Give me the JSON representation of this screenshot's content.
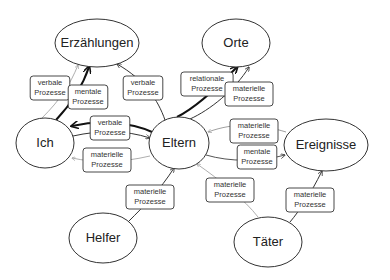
{
  "nodes": [
    {
      "id": "erzaehlungen",
      "label": "Erzählungen",
      "cx": 97,
      "cy": 43,
      "rx": 42,
      "ry": 24
    },
    {
      "id": "orte",
      "label": "Orte",
      "cx": 236,
      "cy": 43,
      "rx": 34,
      "ry": 24
    },
    {
      "id": "ich",
      "label": "Ich",
      "cx": 45,
      "cy": 143,
      "rx": 29,
      "ry": 25
    },
    {
      "id": "eltern",
      "label": "Eltern",
      "cx": 179,
      "cy": 143,
      "rx": 30,
      "ry": 26
    },
    {
      "id": "ereignisse",
      "label": "Ereignisse",
      "cx": 326,
      "cy": 145,
      "rx": 42,
      "ry": 26
    },
    {
      "id": "helfer",
      "label": "Helfer",
      "cx": 103,
      "cy": 238,
      "rx": 34,
      "ry": 25
    },
    {
      "id": "taeter",
      "label": "Täter",
      "cx": 268,
      "cy": 242,
      "rx": 34,
      "ry": 25
    }
  ],
  "edges": [
    {
      "from": "ich",
      "to": "erzaehlungen",
      "label_line1": "verbale",
      "label_line2": "Prozesse",
      "lx": 50,
      "ly": 88,
      "weight": "thin",
      "color": "#999999",
      "path": "M42 118 C 60 100, 70 85, 78 65"
    },
    {
      "from": "ich",
      "to": "erzaehlungen",
      "label_line1": "mentale",
      "label_line2": "Prozesse",
      "lx": 88,
      "ly": 97,
      "weight": "bold",
      "color": "#111111",
      "path": "M56 120 C 70 105, 82 88, 89 67"
    },
    {
      "from": "eltern",
      "to": "erzaehlungen",
      "label_line1": "verbale",
      "label_line2": "Prozesse",
      "lx": 143,
      "ly": 88,
      "weight": "normal",
      "color": "#333333",
      "path": "M165 120 C 158 100, 145 80, 117 64"
    },
    {
      "from": "eltern",
      "to": "orte",
      "label_line1": "relationale",
      "label_line2": "Prozesse",
      "lx": 207,
      "ly": 84,
      "weight": "bold",
      "color": "#111111",
      "path": "M177 117 C 195 108, 215 90, 237 67"
    },
    {
      "from": "eltern",
      "to": "orte",
      "label_line1": "materielle",
      "label_line2": "Prozesse",
      "lx": 249,
      "ly": 94,
      "weight": "normal",
      "color": "#333333",
      "path": "M190 119 C 210 110, 235 90, 249 67"
    },
    {
      "from": "eltern",
      "to": "ich",
      "label_line1": "verbale",
      "label_line2": "Prozesse",
      "lx": 110,
      "ly": 128,
      "weight": "bold",
      "color": "#111111",
      "path": "M152 132 C 130 122, 100 120, 72 126"
    },
    {
      "from": "ich",
      "to": "eltern",
      "label_line1": "",
      "label_line2": "",
      "lx": 0,
      "ly": 0,
      "weight": "normal",
      "color": "#333333",
      "path": "M73 136 C 100 130, 125 130, 150 138"
    },
    {
      "from": "eltern",
      "to": "ich",
      "label_line1": "materielle",
      "label_line2": "Prozesse",
      "lx": 107,
      "ly": 160,
      "weight": "thin",
      "color": "#999999",
      "path": "M150 156 C 120 163, 95 163, 72 158"
    },
    {
      "from": "ereignisse",
      "to": "eltern",
      "label_line1": "materielle",
      "label_line2": "Prozesse",
      "lx": 254,
      "ly": 131,
      "weight": "thin",
      "color": "#888888",
      "path": "M286 132 C 260 124, 235 122, 208 132"
    },
    {
      "from": "eltern",
      "to": "ereignisse",
      "label_line1": "mentale",
      "label_line2": "Prozesse",
      "lx": 257,
      "ly": 157,
      "weight": "normal",
      "color": "#555555",
      "path": "M206 155 C 230 162, 260 162, 285 155"
    },
    {
      "from": "helfer",
      "to": "eltern",
      "label_line1": "materielle",
      "label_line2": "Prozesse",
      "lx": 150,
      "ly": 197,
      "weight": "normal",
      "color": "#333333",
      "path": "M128 222 C 145 205, 160 190, 174 168"
    },
    {
      "from": "taeter",
      "to": "eltern",
      "label_line1": "materielle",
      "label_line2": "Prozesse",
      "lx": 230,
      "ly": 190,
      "weight": "thin",
      "color": "#999999",
      "path": "M258 217 C 245 200, 220 180, 197 164"
    },
    {
      "from": "taeter",
      "to": "ereignisse",
      "label_line1": "materielle",
      "label_line2": "Prozesse",
      "lx": 310,
      "ly": 200,
      "weight": "normal",
      "color": "#333333",
      "path": "M290 222 C 300 210, 310 195, 322 171"
    }
  ],
  "colors": {
    "node_stroke": "#333333",
    "label_box_stroke": "#333333",
    "background": "#ffffff"
  }
}
